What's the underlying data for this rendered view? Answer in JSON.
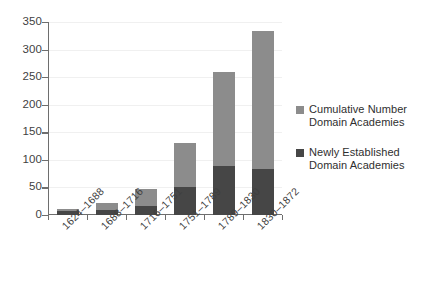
{
  "chart_data": {
    "type": "bar",
    "stacked": true,
    "title": "",
    "xlabel": "",
    "ylabel": "",
    "categories": [
      "1624–1688",
      "1688–1716",
      "1716–1751",
      "1751–1789",
      "1789–1830",
      "1830–1872"
    ],
    "series": [
      {
        "name": "Newly Established Domain Academies",
        "color": "#464646",
        "values": [
          7,
          9,
          17,
          50,
          88,
          83
        ]
      },
      {
        "name": "Cumulative Number Domain Academies",
        "color": "#8c8c8c",
        "values": [
          11,
          22,
          48,
          130,
          260,
          333
        ]
      }
    ],
    "ylim": [
      0,
      350
    ],
    "yticks": [
      0,
      50,
      100,
      150,
      200,
      250,
      300,
      350
    ],
    "ytick_labels": [
      "0",
      "50",
      "100",
      "150",
      "200",
      "250",
      "300",
      "350"
    ],
    "grid": true,
    "legend_position": "right"
  },
  "legend": {
    "entries": [
      {
        "label_line1": "Cumulative Number",
        "label_line2": "Domain Academies",
        "swatch": "#8c8c8c"
      },
      {
        "label_line1": "Newly Established",
        "label_line2": "Domain Academies",
        "swatch": "#464646"
      }
    ]
  },
  "colors": {
    "cumulative": "#8c8c8c",
    "newly_established": "#464646",
    "axis": "#6e6e6e",
    "grid": "#f0f0f0",
    "text": "#3f3f3f",
    "background": "#ffffff"
  }
}
